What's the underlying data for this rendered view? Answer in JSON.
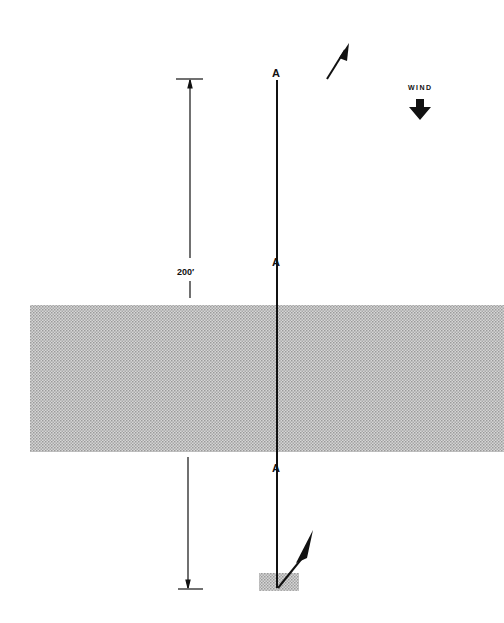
{
  "diagram": {
    "type": "wind-drift-track-diagram",
    "dimension_label": "200′",
    "wind_label": "WIND",
    "wind_direction": "down",
    "points": [
      {
        "label": "A",
        "x": 277,
        "y": 72
      },
      {
        "label": "A",
        "x": 277,
        "y": 261
      },
      {
        "label": "A",
        "x": 277,
        "y": 467
      }
    ],
    "shaded_band": {
      "x": 30,
      "y": 305,
      "width": 474,
      "height": 147,
      "color": "#b8b8b8"
    },
    "start_marker": {
      "x": 259,
      "y": 573,
      "width": 40,
      "height": 18
    },
    "colors": {
      "line": "#111111",
      "shade": "#bdbdbd",
      "background": "#ffffff"
    }
  }
}
